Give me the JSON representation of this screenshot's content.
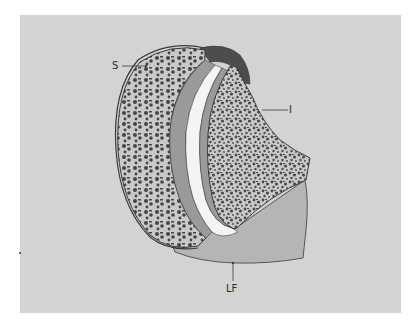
{
  "figure": {
    "colors": {
      "background": "#d3d3d3",
      "bone_cortex": "#c6c6c6",
      "trabecular_dark": "#4a4a4a",
      "cartilage": "#9a9a9a",
      "joint_space": "#f4f4f4",
      "ligament_cap": "#4d4d4d",
      "lower_tissue": "#b4b4b4",
      "outline": "#3a3a3a"
    }
  },
  "labels": {
    "sacrum": "S",
    "ilium": "I",
    "ligament": "LF"
  }
}
